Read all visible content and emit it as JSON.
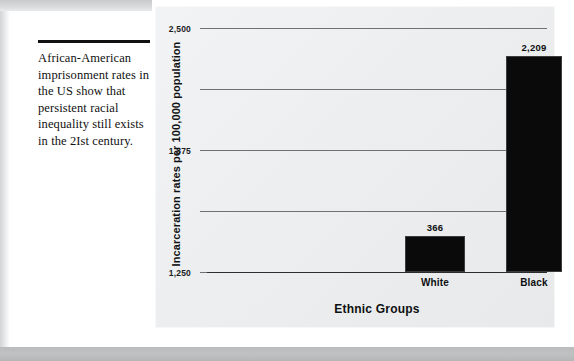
{
  "caption": {
    "text": "African-American imprisonment rates in the US show that persistent racial inequality still exists in the 2Ist century."
  },
  "chart_data": {
    "type": "bar",
    "title": "",
    "xlabel": "Ethnic Groups",
    "ylabel": "Incarceration rates per 100,000 population",
    "categories": [
      "White",
      "Black",
      "Latino"
    ],
    "values": [
      366,
      2209,
      759
    ],
    "value_labels": [
      "366",
      "2,209",
      "759"
    ],
    "bar_colors": [
      "#0a0a0a",
      "#0a0a0a",
      "#6b6b6b"
    ],
    "ylim": [
      0,
      2500
    ],
    "yticks": [
      0,
      625,
      1250,
      1875,
      2500
    ],
    "ytick_labels": [
      "0",
      "625",
      "1,250",
      "1,875",
      "2,500"
    ],
    "grid": true,
    "legend": "none"
  },
  "colors": {
    "panel_background": "#eceeef",
    "gridline": "#6f7173",
    "axis": "#2b2d2f",
    "text": "#0d0f11",
    "frame_band": "#bfc1c3"
  }
}
